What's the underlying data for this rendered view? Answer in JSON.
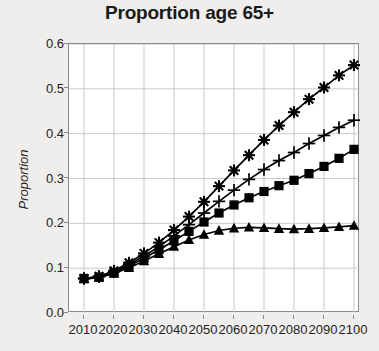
{
  "chart_data": {
    "type": "line",
    "title": "Proportion age 65+",
    "xlabel": "",
    "ylabel": "Proportion",
    "xlim": [
      2005,
      2102
    ],
    "ylim": [
      0.0,
      0.6
    ],
    "grid": true,
    "legend": "none",
    "y_ticks": [
      "0.0",
      "0.1",
      "0.2",
      "0.3",
      "0.4",
      "0.5",
      "0.6"
    ],
    "y_tick_values": [
      0.0,
      0.1,
      0.2,
      0.3,
      0.4,
      0.5,
      0.6
    ],
    "x_ticks": [
      "2010",
      "2020",
      "2030",
      "2040",
      "2050",
      "2060",
      "2070",
      "2080",
      "2090",
      "2100"
    ],
    "x_tick_values": [
      2010,
      2020,
      2030,
      2040,
      2050,
      2060,
      2070,
      2080,
      2090,
      2100
    ],
    "x": [
      2010,
      2015,
      2020,
      2025,
      2030,
      2035,
      2040,
      2045,
      2050,
      2055,
      2060,
      2065,
      2070,
      2075,
      2080,
      2085,
      2090,
      2095,
      2100
    ],
    "series": [
      {
        "name": "series-star",
        "marker": "star",
        "color": "#000000",
        "values": [
          0.077,
          0.082,
          0.094,
          0.112,
          0.133,
          0.157,
          0.185,
          0.215,
          0.248,
          0.283,
          0.318,
          0.352,
          0.386,
          0.418,
          0.448,
          0.477,
          0.503,
          0.53,
          0.553
        ]
      },
      {
        "name": "series-plus",
        "marker": "plus",
        "color": "#000000",
        "values": [
          0.077,
          0.081,
          0.092,
          0.108,
          0.127,
          0.148,
          0.172,
          0.197,
          0.223,
          0.249,
          0.274,
          0.298,
          0.32,
          0.34,
          0.358,
          0.378,
          0.396,
          0.414,
          0.43
        ]
      },
      {
        "name": "series-square",
        "marker": "square",
        "color": "#000000",
        "values": [
          0.077,
          0.08,
          0.09,
          0.105,
          0.122,
          0.141,
          0.161,
          0.182,
          0.203,
          0.223,
          0.241,
          0.257,
          0.271,
          0.284,
          0.296,
          0.311,
          0.327,
          0.345,
          0.365
        ]
      },
      {
        "name": "series-triangle",
        "marker": "triangle",
        "color": "#000000",
        "values": [
          0.076,
          0.079,
          0.088,
          0.101,
          0.116,
          0.132,
          0.148,
          0.163,
          0.175,
          0.184,
          0.189,
          0.191,
          0.19,
          0.188,
          0.187,
          0.188,
          0.19,
          0.192,
          0.195
        ]
      }
    ]
  }
}
